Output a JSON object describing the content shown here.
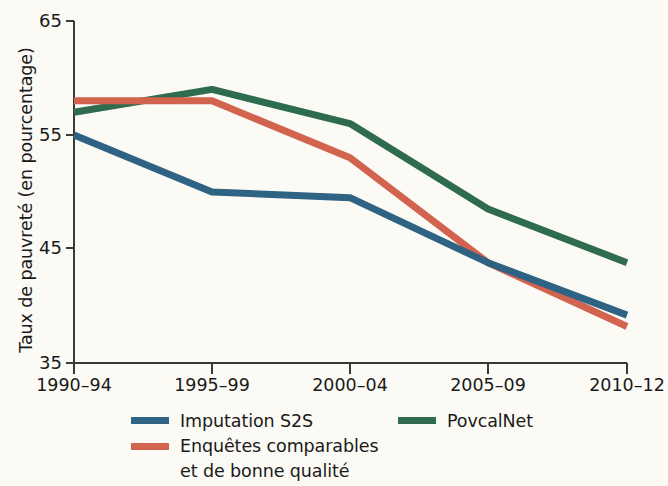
{
  "chart_data": {
    "type": "line",
    "title": "",
    "xlabel": "",
    "ylabel": "Taux de pauvreté (en pourcentage)",
    "categories": [
      "1990–94",
      "1995–99",
      "2000–04",
      "2005–09",
      "2010–12"
    ],
    "ylim": [
      35,
      65
    ],
    "yticks": [
      35,
      45,
      55,
      65
    ],
    "ytick_labels": [
      "35",
      "45",
      "55",
      "65"
    ],
    "grid": false,
    "legend_position": "below-axes",
    "series": [
      {
        "name": "Imputation S2S",
        "color": "#2e6384",
        "values": [
          55.0,
          50.0,
          49.5,
          43.8,
          39.2
        ]
      },
      {
        "name": "Enquêtes comparables et de bonne qualité",
        "color": "#d1634f",
        "values": [
          58.0,
          58.0,
          53.0,
          43.8,
          38.2
        ]
      },
      {
        "name": "PovcalNet",
        "color": "#2f6b4f",
        "values": [
          57.0,
          59.0,
          56.0,
          48.5,
          43.8
        ]
      }
    ]
  },
  "axis": {
    "ylabel": "Taux de pauvreté (en pourcentage)",
    "ytick_0": "35",
    "ytick_1": "45",
    "ytick_2": "55",
    "ytick_3": "65",
    "xtick_0": "1990–94",
    "xtick_1": "1995–99",
    "xtick_2": "2000–04",
    "xtick_3": "2005–09",
    "xtick_4": "2010–12"
  },
  "legend": {
    "item_0_label": "Imputation S2S",
    "item_0_color": "#2e6384",
    "item_1_label_line1": "Enquêtes comparables",
    "item_1_label_line2": "et de bonne qualité",
    "item_1_color": "#d1634f",
    "item_2_label": "PovcalNet",
    "item_2_color": "#2f6b4f"
  },
  "colors": {
    "background": "#fbfaf4",
    "axis": "#3a3a35",
    "text": "#1a1a1a",
    "series_blue": "#2e6384",
    "series_red": "#d1634f",
    "series_green": "#2f6b4f"
  }
}
